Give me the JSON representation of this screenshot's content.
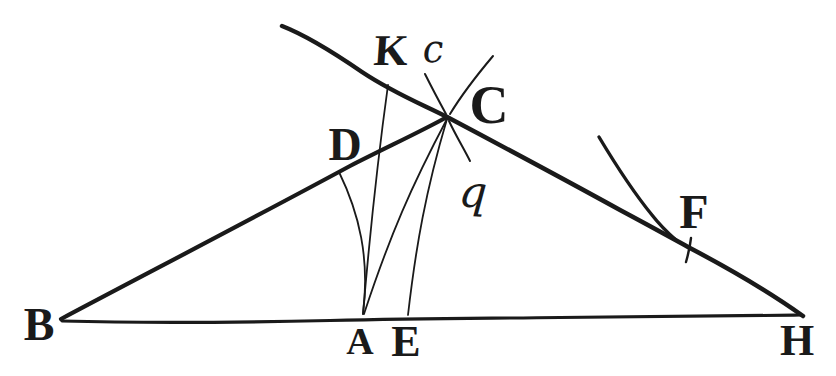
{
  "colors": {
    "ink": "#1a1a1a",
    "paper": "#ffffff"
  },
  "figure": {
    "type": "geometric-diagram",
    "point_labels": {
      "B": "B",
      "K": "K",
      "c": "c",
      "C": "C",
      "D": "D",
      "q": "q",
      "F": "F",
      "A": "A",
      "E": "E",
      "H": "H"
    },
    "segments": [
      "B-H baseline",
      "B-C thick line",
      "K-C-F-H thick line",
      "K-A thin line",
      "D-A thin arc",
      "C-A thin line",
      "C-E thin line",
      "c-C thin stroke",
      "C-q thin stroke",
      "C upper-right thin ray",
      "arc meeting line at F",
      "tick mark at F"
    ]
  }
}
